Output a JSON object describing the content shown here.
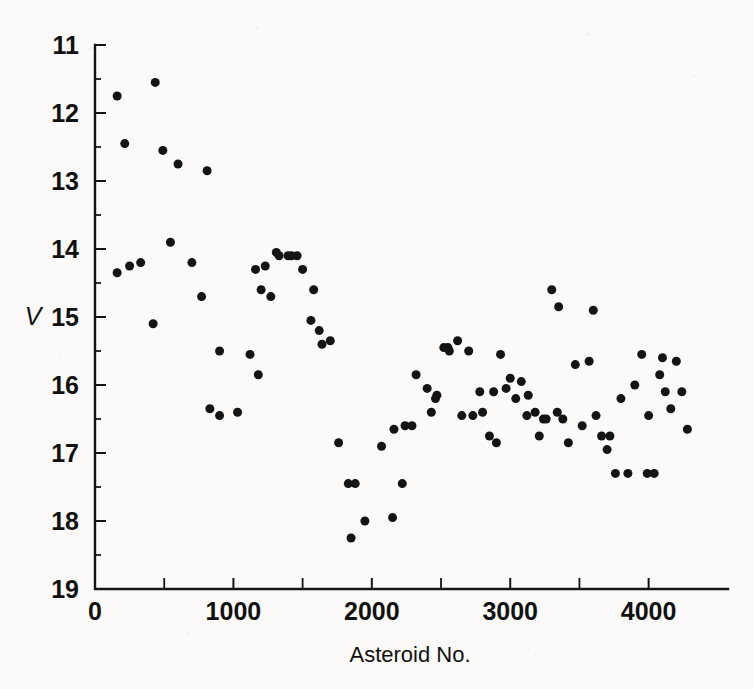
{
  "figure": {
    "background_color": "#fbfaf8",
    "ink_color": "#141414"
  },
  "chart_data": {
    "type": "scatter",
    "title": "",
    "xlabel": "Asteroid No.",
    "ylabel": "V",
    "xlim": [
      0,
      4400
    ],
    "ylim": [
      11,
      19
    ],
    "y_inverted": true,
    "grid": false,
    "legend": null,
    "xticks": [
      0,
      1000,
      2000,
      3000,
      4000
    ],
    "xtick_labels": [
      "0",
      "1000",
      "2000",
      "3000",
      "4000"
    ],
    "xticks_minor": [
      500,
      1500,
      2500,
      3500
    ],
    "yticks": [
      11,
      12,
      13,
      14,
      15,
      16,
      17,
      18,
      19
    ],
    "ytick_labels": [
      "11",
      "12",
      "13",
      "14",
      "15",
      "16",
      "17",
      "18",
      "19"
    ],
    "marker": "filled-circle",
    "marker_size_px": 9,
    "point_count": 101,
    "x": [
      160,
      435,
      215,
      490,
      600,
      810,
      250,
      160,
      330,
      420,
      545,
      700,
      770,
      900,
      1030,
      830,
      900,
      1120,
      1200,
      1230,
      1270,
      1330,
      1395,
      1460,
      1180,
      1500,
      1560,
      1580,
      1620,
      1640,
      1700,
      1760,
      1830,
      1160,
      1850,
      1880,
      1950,
      2070,
      2150,
      2160,
      2220,
      2240,
      2320,
      2400,
      2430,
      2470,
      2520,
      2560,
      2620,
      2650,
      2700,
      2730,
      2800,
      2850,
      2880,
      2930,
      2970,
      3000,
      3040,
      3080,
      3130,
      3180,
      3210,
      3260,
      3300,
      3340,
      3380,
      3420,
      3470,
      3520,
      3570,
      3620,
      3660,
      3700,
      3760,
      3800,
      3850,
      3900,
      3950,
      3990,
      4040,
      4080,
      4120,
      4160,
      4200,
      4240,
      4280,
      2290,
      2460,
      2550,
      2900,
      3120,
      3350,
      3600,
      3720,
      4000,
      4100,
      1310,
      1420,
      2780,
      3240
    ],
    "y": [
      11.75,
      11.55,
      12.45,
      12.55,
      12.75,
      12.85,
      14.25,
      14.35,
      14.2,
      15.1,
      13.9,
      14.2,
      14.7,
      16.45,
      16.4,
      16.35,
      15.5,
      15.55,
      14.6,
      14.25,
      14.7,
      14.1,
      14.1,
      14.1,
      15.85,
      14.3,
      15.05,
      14.6,
      15.2,
      15.4,
      15.35,
      16.85,
      17.45,
      14.3,
      18.25,
      17.45,
      18.0,
      16.9,
      17.95,
      16.65,
      17.45,
      16.6,
      15.85,
      16.05,
      16.4,
      16.15,
      15.45,
      15.5,
      15.35,
      16.45,
      15.5,
      16.45,
      16.4,
      16.75,
      16.1,
      15.55,
      16.05,
      15.9,
      16.2,
      15.95,
      16.15,
      16.4,
      16.75,
      16.5,
      14.6,
      16.4,
      16.5,
      16.85,
      15.7,
      16.6,
      15.65,
      16.45,
      16.75,
      16.95,
      17.3,
      16.2,
      17.3,
      16.0,
      15.55,
      17.3,
      17.3,
      15.85,
      16.1,
      16.35,
      15.65,
      16.1,
      16.65,
      16.6,
      16.2,
      15.45,
      16.85,
      16.45,
      14.85,
      14.9,
      16.75,
      16.45,
      15.6,
      14.05,
      14.1,
      16.1,
      16.5
    ]
  }
}
